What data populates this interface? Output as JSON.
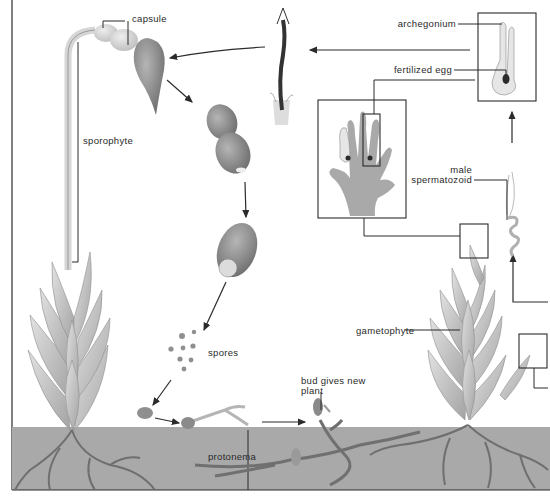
{
  "diagram": {
    "colors": {
      "ink": "#2b2b2b",
      "soil": "#a9a9a9",
      "soil_dark": "#8e8e8e",
      "leaf": "#c9c9c9",
      "leaf_dark": "#9c9c9c",
      "capsule": "#8a8a8a",
      "capsule_light": "#d4d4d4",
      "spore": "#8f8f8f",
      "background": "#ffffff"
    },
    "labels": {
      "capsule": "capsule",
      "sporophyte": "sporophyte",
      "spores": "spores",
      "protonema": "protonema",
      "bud_line1": "bud gives new",
      "bud_line2": "plant",
      "gametophyte": "gametophyte",
      "archegonium": "archegonium",
      "fertilized_egg": "fertilized egg",
      "male_line1": "male",
      "male_line2": "spermatozoid"
    },
    "stages": [
      "sporophyte with capsule",
      "capsule opening",
      "capsule releasing spores",
      "spores",
      "germinating spore",
      "protonema",
      "bud gives new plant",
      "gametophyte",
      "male spermatozoid",
      "archegonium with fertilized egg",
      "young sporophyte"
    ]
  }
}
